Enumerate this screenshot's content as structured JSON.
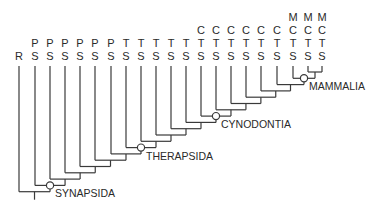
{
  "diagram": {
    "type": "cladogram",
    "tips": [
      {
        "x": 19,
        "labels": [
          "R"
        ]
      },
      {
        "x": 35,
        "labels": [
          "P",
          "S"
        ]
      },
      {
        "x": 50,
        "labels": [
          "P",
          "S"
        ]
      },
      {
        "x": 65,
        "labels": [
          "P",
          "S"
        ]
      },
      {
        "x": 80,
        "labels": [
          "P",
          "S"
        ]
      },
      {
        "x": 95,
        "labels": [
          "P",
          "S"
        ]
      },
      {
        "x": 111,
        "labels": [
          "P",
          "S"
        ]
      },
      {
        "x": 126,
        "labels": [
          "T",
          "S"
        ]
      },
      {
        "x": 141,
        "labels": [
          "T",
          "S"
        ]
      },
      {
        "x": 156,
        "labels": [
          "T",
          "S"
        ]
      },
      {
        "x": 171,
        "labels": [
          "T",
          "S"
        ]
      },
      {
        "x": 186,
        "labels": [
          "T",
          "S"
        ]
      },
      {
        "x": 201,
        "labels": [
          "C",
          "T",
          "S"
        ]
      },
      {
        "x": 216,
        "labels": [
          "C",
          "T",
          "S"
        ]
      },
      {
        "x": 231,
        "labels": [
          "C",
          "T",
          "S"
        ]
      },
      {
        "x": 246,
        "labels": [
          "C",
          "T",
          "S"
        ]
      },
      {
        "x": 261,
        "labels": [
          "C",
          "T",
          "S"
        ]
      },
      {
        "x": 277,
        "labels": [
          "C",
          "T",
          "S"
        ]
      },
      {
        "x": 293,
        "labels": [
          "M",
          "C",
          "T",
          "S"
        ]
      },
      {
        "x": 308,
        "labels": [
          "M",
          "C",
          "T",
          "S"
        ]
      },
      {
        "x": 322,
        "labels": [
          "M",
          "C",
          "T",
          "S"
        ]
      }
    ],
    "clades": [
      {
        "name": "SYNAPSIDA",
        "tip_index": 1
      },
      {
        "name": "THERAPSIDA",
        "tip_index": 7
      },
      {
        "name": "CYNODONTIA",
        "tip_index": 12
      },
      {
        "name": "MAMMALIA",
        "tip_index": 18
      }
    ],
    "colors": {
      "line": "#3a3a3a",
      "text": "#2a2a2a",
      "background": "#ffffff"
    }
  }
}
